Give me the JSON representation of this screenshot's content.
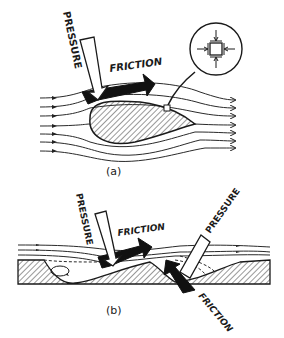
{
  "figure_a": {
    "caption": "(a)",
    "pressure_label": "PRESSURE",
    "friction_label": "FRICTION",
    "inset": "stress-element-detail"
  },
  "figure_b": {
    "caption": "(b)",
    "pressure_label_left": "PRESSURE",
    "friction_label_left": "FRICTION",
    "pressure_label_right": "PRESSURE",
    "friction_label_right": "FRICTION"
  },
  "colors": {
    "ink": "#1a1a1a",
    "background": "#ffffff",
    "arrow_fill_dark": "#111111",
    "arrow_fill_light": "#ffffff"
  }
}
